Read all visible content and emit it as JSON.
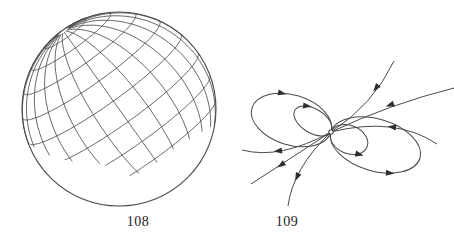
{
  "page": {
    "background": "#ffffff",
    "ink": "#4a4a4a",
    "arrow_ink": "#2e2e2e",
    "label_color": "#1d1d1d"
  },
  "figures": {
    "sphere": {
      "label": "108",
      "description": "Sphere covered by a coordinate net of meridians and parallels; net ends in a ragged edge, lower part of sphere bare",
      "cx": 119,
      "cy": 109,
      "r": 97,
      "outline_stroke": 1.1,
      "grid_stroke": 0.85,
      "pole": [
        -0.573,
        -0.804,
        0.161
      ],
      "meridian_count": 24,
      "lat_min_deg": -52,
      "lat_max_deg": 86,
      "parallel_lats_deg": [
        75,
        60,
        45,
        30,
        15,
        0,
        -15,
        -30,
        -45
      ],
      "net_boundary": [
        [
          4,
          118
        ],
        [
          28,
          143
        ],
        [
          40,
          151
        ],
        [
          53,
          157
        ],
        [
          68,
          161
        ],
        [
          85,
          163
        ],
        [
          102,
          164
        ],
        [
          118,
          171
        ],
        [
          133,
          177
        ],
        [
          148,
          168
        ],
        [
          158,
          162
        ],
        [
          168,
          153
        ],
        [
          180,
          145
        ],
        [
          192,
          138
        ],
        [
          205,
          130
        ],
        [
          215,
          125
        ],
        [
          226,
          114
        ],
        [
          234,
          104
        ],
        [
          238,
          0
        ],
        [
          4,
          0
        ]
      ]
    },
    "flow": {
      "label": "109",
      "description": "Stream lines of a vector field around a dipole singular point: four loop orbits and six open trajectories",
      "stroke": 1.0,
      "center": {
        "x": 331,
        "y": 132,
        "dot_radius": 2.2
      },
      "petals": [
        {
          "tip": [
            252,
            108
          ],
          "halfwidth": 25,
          "arrow_side": "top",
          "arrow_dx": 2,
          "arrow_angle": 12
        },
        {
          "tip": [
            295,
            110
          ],
          "halfwidth": 12,
          "arrow_side": "top",
          "arrow_dx": 3,
          "arrow_angle": 8
        },
        {
          "tip": [
            420,
            158
          ],
          "halfwidth": 26,
          "arrow_side": "bottom",
          "arrow_dx": 0,
          "arrow_angle": 4
        },
        {
          "tip": [
            367,
            147
          ],
          "halfwidth": 14,
          "arrow_side": "bottom",
          "arrow_dx": 6,
          "arrow_angle": 14
        }
      ],
      "rays": [
        {
          "from": [
            394,
            61
          ],
          "ctrl": [
            373,
            105
          ],
          "arrow": {
            "x": 376,
            "y": 88,
            "angle": 128
          }
        },
        {
          "from": [
            454,
            88
          ],
          "ctrl": [
            390,
            104
          ],
          "arrow": {
            "x": 390,
            "y": 105,
            "angle": 160
          }
        },
        {
          "from": [
            437,
            144
          ],
          "ctrl": [
            395,
            116
          ],
          "arrow": {
            "x": 392,
            "y": 127,
            "angle": 186
          }
        },
        {
          "from": [
            242,
            150
          ],
          "ctrl": [
            280,
            160
          ],
          "arrow": {
            "x": 278,
            "y": 151,
            "angle": 173
          }
        },
        {
          "from": [
            251,
            184
          ],
          "ctrl": [
            291,
            158
          ],
          "arrow": {
            "x": 281,
            "y": 165,
            "angle": 147
          }
        },
        {
          "from": [
            288,
            206
          ],
          "ctrl": [
            293,
            168
          ],
          "arrow": {
            "x": 297,
            "y": 177,
            "angle": 115
          }
        }
      ]
    }
  }
}
